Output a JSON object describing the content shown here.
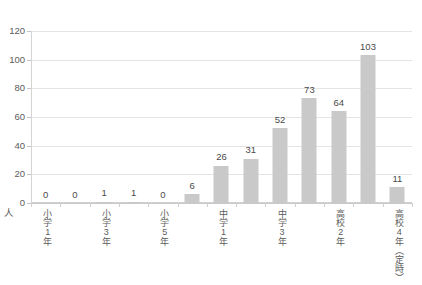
{
  "chart_data": {
    "type": "bar",
    "title": "",
    "xlabel": "",
    "ylabel": "",
    "unit_label": "人",
    "ylim": [
      0,
      120
    ],
    "y_ticks": [
      0,
      20,
      40,
      60,
      80,
      100,
      120
    ],
    "grid": true,
    "legend": "none",
    "categories": [
      "小学1年",
      "",
      "小学3年",
      "",
      "小学5年",
      "",
      "中学1年",
      "",
      "中学3年",
      "",
      "高校2年",
      "",
      "高校4年（定時）"
    ],
    "values": [
      0,
      0,
      1,
      1,
      0,
      6,
      26,
      31,
      52,
      73,
      64,
      103,
      11
    ],
    "bar_color": "#c9c9c9",
    "gridline_color": "#e4e4e4",
    "text_color": "#5c5c5c"
  }
}
